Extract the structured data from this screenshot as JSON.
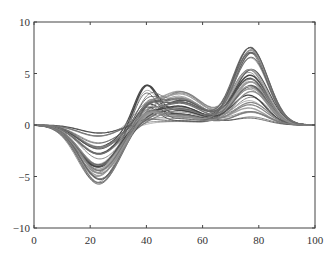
{
  "chart_data": {
    "type": "line",
    "title": "",
    "xlabel": "",
    "ylabel": "",
    "xlim": [
      0,
      100
    ],
    "ylim": [
      -10,
      10
    ],
    "grid": false,
    "legend": null,
    "x_ticks": [
      0,
      20,
      40,
      60,
      80,
      100
    ],
    "x_tick_labels": [
      "0",
      "20",
      "40",
      "60",
      "80",
      "100"
    ],
    "y_ticks": [
      10,
      5,
      0,
      -5,
      -10
    ],
    "y_tick_labels": [
      "10",
      "5",
      "0",
      "−5",
      "−10"
    ],
    "n_series": 40,
    "envelope": {
      "x": [
        0,
        5,
        10,
        15,
        20,
        23,
        27,
        30,
        35,
        40,
        45,
        50,
        55,
        60,
        65,
        70,
        75,
        77,
        80,
        85,
        90,
        95,
        100
      ],
      "upper": [
        0,
        -0.05,
        -0.1,
        -0.05,
        0,
        0,
        0.1,
        0.5,
        2.2,
        3.7,
        3.0,
        3.2,
        3.2,
        2.4,
        1.4,
        3.8,
        7.3,
        7.8,
        6.8,
        3.0,
        0.8,
        0.1,
        0
      ],
      "lower": [
        0,
        -0.3,
        -1.2,
        -3.2,
        -5.6,
        -6.4,
        -5.8,
        -4.0,
        -1.3,
        -0.3,
        -0.4,
        -0.5,
        -0.5,
        -0.4,
        -0.3,
        -0.2,
        -0.1,
        -0.1,
        -0.1,
        -0.05,
        0,
        0,
        0
      ]
    },
    "components": [
      {
        "name": "negative trough",
        "center_x": 23,
        "peak_y": -6.5,
        "width": 7
      },
      {
        "name": "narrow peak",
        "center_x": 40,
        "peak_y": 3.7,
        "width": 4
      },
      {
        "name": "broad hump",
        "center_x": 52,
        "peak_y": 3.3,
        "width": 8
      },
      {
        "name": "large peak",
        "center_x": 77,
        "peak_y": 7.8,
        "width": 6
      }
    ],
    "line_color": "#555555"
  },
  "axes": {
    "frame": {
      "left": 34,
      "top": 22,
      "right": 315,
      "bottom": 228
    },
    "color": "#444444"
  }
}
